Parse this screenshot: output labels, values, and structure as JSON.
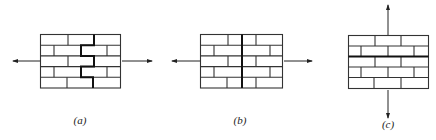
{
  "figure": {
    "panels": [
      {
        "id": "a",
        "label": "(a)",
        "description": "Brick wall under horizontal tension; stepped (zigzag) crack along mortar joints",
        "loading": "horizontal tension (arrows left and right)",
        "crack": "stepped along head and bed joints"
      },
      {
        "id": "b",
        "label": "(b)",
        "description": "Brick wall under horizontal tension; straight vertical crack through bricks and joints",
        "loading": "horizontal tension (arrows left and right)",
        "crack": "straight vertical through units"
      },
      {
        "id": "c",
        "label": "(c)",
        "description": "Brick wall under vertical tension; failure along horizontal bed joint",
        "loading": "vertical tension (arrows up and down)",
        "crack": "horizontal along bed joint"
      }
    ],
    "colors": {
      "line": "#333333",
      "crack": "#111111",
      "background": "#ffffff"
    }
  }
}
